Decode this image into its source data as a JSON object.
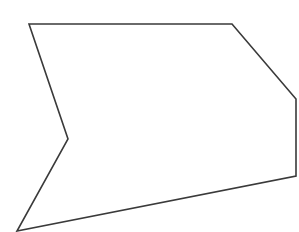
{
  "canvas": {
    "width": 299,
    "height": 232,
    "background": "#ffffff"
  },
  "shape": {
    "type": "polygon",
    "description": "irregular hexagon with one concave (reflex) vertex on the left side",
    "stroke": "#3a3a3a",
    "stroke_width": 1.6,
    "fill": "none",
    "points": [
      [
        29,
        24
      ],
      [
        232,
        24
      ],
      [
        296,
        99
      ],
      [
        296,
        176
      ],
      [
        17,
        231
      ],
      [
        68,
        139
      ]
    ],
    "points_attr": "29,24 232,24 296,99 296,176 17,231 68,139"
  }
}
